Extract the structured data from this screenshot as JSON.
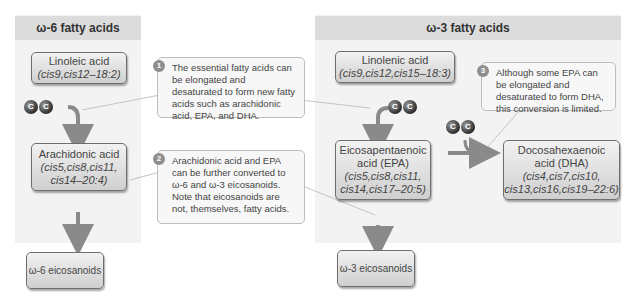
{
  "caption_fragment": "... ngested and desaturated ... fatty acids ...",
  "panels": {
    "omega6": {
      "title": "ω-6 fatty acids"
    },
    "omega3": {
      "title": "ω-3 fatty acids"
    }
  },
  "boxes": {
    "linoleic": {
      "name": "Linoleic acid",
      "formula": "(cis9,cis12–18:2)"
    },
    "arachidonic": {
      "name": "Arachidonic acid",
      "formula_l1": "(cis5,cis8,cis11,",
      "formula_l2": "cis14–20:4)"
    },
    "omega6_eicosanoids": {
      "name": "ω-6 eicosanoids"
    },
    "linolenic": {
      "name": "Linolenic acid",
      "formula": "(cis9,cis12,cis15–18:3)"
    },
    "epa": {
      "name_l1": "Eicosapentaenoic",
      "name_l2": "acid (EPA)",
      "formula_l1": "(cis5,cis8,cis11,",
      "formula_l2": "cis14,cis17–20:5)"
    },
    "dha": {
      "name_l1": "Docosahexaenoic",
      "name_l2": "acid (DHA)",
      "formula_l1": "(cis4,cis7,cis10,",
      "formula_l2": "cis13,cis16,cis19–22:6)"
    },
    "omega3_eicosanoids": {
      "name": "ω-3 eicosanoids"
    }
  },
  "notes": [
    {
      "number": "1",
      "text": "The essential fatty acids can be elongated and desaturated to form new fatty acids such as arachidonic acid, EPA, and DHA."
    },
    {
      "number": "2",
      "text": "Arachidonic acid and EPA can be further converted to ω-6 and ω-3 eicosanoids. Note that eicosanoids are not, themselves, fatty acids."
    },
    {
      "number": "3",
      "text": "Although some EPA can be elongated and desaturated to form DHA, this conversion is limited."
    }
  ],
  "carbon_label": "C",
  "colors": {
    "panel_bg": "#f3f3f3",
    "panel_header": "#dcdcdc",
    "arrow": "#8a8a8a",
    "box_border": "#6e6e6e"
  }
}
